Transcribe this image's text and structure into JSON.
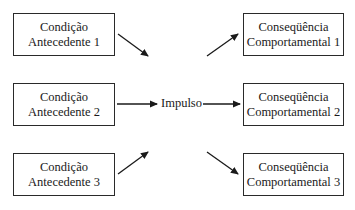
{
  "diagram": {
    "antecedents": [
      {
        "line1": "Condição",
        "line2": "Antecedente 1"
      },
      {
        "line1": "Condição",
        "line2": "Antecedente 2"
      },
      {
        "line1": "Condição",
        "line2": "Antecedente 3"
      }
    ],
    "center_label": "Impulso",
    "consequences": [
      {
        "line1": "Conseqüência",
        "line2": "Comportamental 1"
      },
      {
        "line1": "Conseqüência",
        "line2": "Comportamental 2"
      },
      {
        "line1": "Conseqüência",
        "line2": "Comportamental 3"
      }
    ],
    "colors": {
      "line": "#1a1a1a",
      "background": "#ffffff"
    }
  }
}
